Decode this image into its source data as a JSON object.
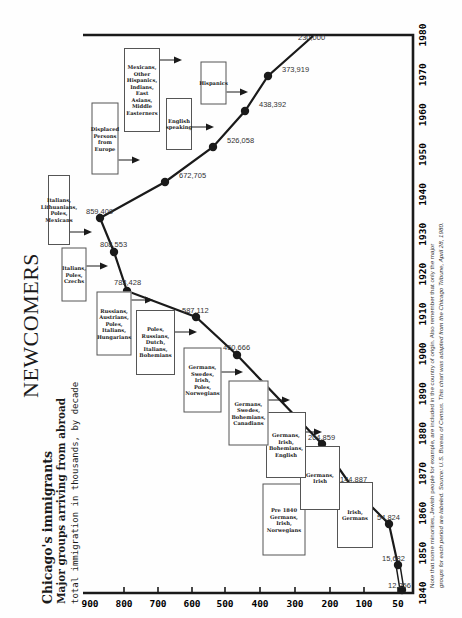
{
  "header": {
    "title": "NEWCOMERS",
    "subtitle_1": "Chicago's immigrants",
    "subtitle_2": "Major groups arriving from abroad",
    "subtitle_3": "total immigration in thousands, by decade"
  },
  "footnote": {
    "line_1": "Note that some minorities, Jewish people for example, are included in the country of origin. Also remember that only the major",
    "line_2": "groups for each period are labeled. Source: U.S. Bureau of Census. This chart was adapted from the Chicago Tribune, April 28, 1980."
  },
  "chart_data": {
    "type": "line",
    "subtitle": "Major groups arriving from abroad; total immigration in thousands, by decade",
    "xlabel": "Decade",
    "ylabel": "Immigrants (thousands)",
    "x": [
      1840,
      1850,
      1860,
      1870,
      1880,
      1890,
      1900,
      1910,
      1920,
      1930,
      1940,
      1950,
      1960,
      1970,
      1980
    ],
    "x_tick_labels": [
      "1840",
      "1850",
      "1860",
      "1870",
      "1880",
      "1890",
      "1900",
      "1910",
      "1920",
      "1930",
      "1940",
      "1950",
      "1960",
      "1970",
      "1980"
    ],
    "y_tick_labels": [
      "900",
      "800",
      "700",
      "600",
      "500",
      "400",
      "300",
      "200",
      "100",
      "50"
    ],
    "ylim": [
      0,
      900
    ],
    "grid": false,
    "legend": "none",
    "orientation_note": "page is rotated 90 degrees counterclockwise",
    "series": [
      {
        "name": "Total immigration",
        "values": [
          12256,
          15682,
          54824,
          144887,
          204859,
          450666,
          587112,
          783428,
          808553,
          859409,
          672705,
          526058,
          438392,
          373919,
          230000
        ],
        "labels": [
          "12,256",
          "15,682",
          "54,824",
          "144,887",
          "204,859",
          "450,666",
          "587,112",
          "783,428",
          "808,553",
          "859,409",
          "672,705",
          "526,058",
          "438,392",
          "373,919",
          "230,000"
        ]
      }
    ],
    "annotations": [
      {
        "period": "Pre 1840",
        "text": "Pre 1840 Germans, Irish, Norwegians"
      },
      {
        "period": "1840s",
        "text": "Irish, Germans"
      },
      {
        "period": "1850s",
        "text": "Germans, Irish"
      },
      {
        "period": "1860s",
        "text": "Germans, Irish, Bohemians, English"
      },
      {
        "period": "1870s",
        "text": "Germans, Swedes, Bohemians, Canadians"
      },
      {
        "period": "1880s",
        "text": "Germans, Swedes, Irish, Poles, Norwegians"
      },
      {
        "period": "1890s",
        "text": "Poles, Russians, Dutch, Italians, Bohemians"
      },
      {
        "period": "1900s",
        "text": "Russians, Austrians, Poles, Italians, Hungarians"
      },
      {
        "period": "1910s",
        "text": "Italians, Poles, Czechs"
      },
      {
        "period": "1920s",
        "text": "Italians, Lithuanians, Poles, Mexicans"
      },
      {
        "period": "1940s",
        "text": "Displaced Persons from Europe"
      },
      {
        "period": "1950s",
        "text": "English speaking"
      },
      {
        "period": "1960s",
        "text": "Mexicans, Other Hispanics, Indians, East Asians, Middle Easterners"
      },
      {
        "period": "1970s",
        "text": "Hispanics"
      }
    ]
  }
}
